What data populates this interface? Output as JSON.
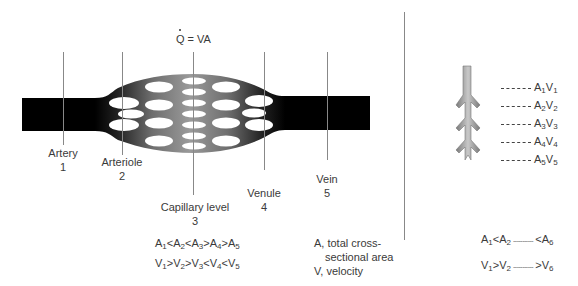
{
  "left_panel": {
    "formula": {
      "q_symbol": "Q",
      "rest": " = VA"
    },
    "vessels": [
      {
        "name": "Artery",
        "number": "1"
      },
      {
        "name": "Arteriole",
        "number": "2"
      },
      {
        "name": "Capillary level",
        "number": "3"
      },
      {
        "name": "Venule",
        "number": "4"
      },
      {
        "name": "Vein",
        "number": "5"
      }
    ],
    "area_relation": [
      {
        "base": "A",
        "sub": "1",
        "op": "<"
      },
      {
        "base": "A",
        "sub": "2",
        "op": "<"
      },
      {
        "base": "A",
        "sub": "3",
        "op": ">"
      },
      {
        "base": "A",
        "sub": "4",
        "op": ">"
      },
      {
        "base": "A",
        "sub": "5",
        "op": ""
      }
    ],
    "velocity_relation": [
      {
        "base": "V",
        "sub": "1",
        "op": ">"
      },
      {
        "base": "V",
        "sub": "2",
        "op": ">"
      },
      {
        "base": "V",
        "sub": "3",
        "op": "<"
      },
      {
        "base": "V",
        "sub": "4",
        "op": "<"
      },
      {
        "base": "V",
        "sub": "5",
        "op": ""
      }
    ],
    "legend": {
      "line1": "A, total cross-",
      "line2": "sectional area",
      "line3": "V, velocity"
    }
  },
  "right_panel": {
    "levels": [
      {
        "a": "1",
        "v": "1"
      },
      {
        "a": "2",
        "v": "2"
      },
      {
        "a": "3",
        "v": "3"
      },
      {
        "a": "4",
        "v": "4"
      },
      {
        "a": "5",
        "v": "5"
      }
    ],
    "area_relation": {
      "start": "A",
      "s1": "1",
      "op1": "<",
      "mid": "A",
      "s2": "2",
      "dots": "-----------",
      "op2": "<",
      "end": "A",
      "s3": "6"
    },
    "velocity_relation": {
      "start": "V",
      "s1": "1",
      "op1": ">",
      "mid": "V",
      "s2": "2",
      "dots": "-----------",
      "op2": ">",
      "end": "V",
      "s3": "6"
    }
  },
  "colors": {
    "vessel_dark": "#000000",
    "capillary_mid": "#8a8a8a",
    "guide_line": "#888888",
    "text": "#3a3a3a"
  }
}
